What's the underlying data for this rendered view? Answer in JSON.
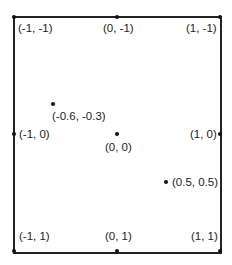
{
  "diagram": {
    "title": "",
    "frame": {
      "left": 13,
      "top": 16,
      "right": 220,
      "bottom": 252
    },
    "edge_points": [
      {
        "label": "(-1, -1)",
        "x": 15,
        "y": 17,
        "lx": 18,
        "ly": 22
      },
      {
        "label": "(0, -1)",
        "x": 117,
        "y": 17,
        "lx": 104,
        "ly": 22
      },
      {
        "label": "(1, -1)",
        "x": 220,
        "y": 17,
        "lx": 187,
        "ly": 22
      },
      {
        "label": "(-1, 0)",
        "x": 14,
        "y": 134,
        "lx": 19,
        "ly": 128
      },
      {
        "label": "(1, 0)",
        "x": 220,
        "y": 134,
        "lx": 190,
        "ly": 128
      },
      {
        "label": "(-1, 1)",
        "x": 14,
        "y": 251,
        "lx": 19,
        "ly": 230
      },
      {
        "label": "(0, 1)",
        "x": 117,
        "y": 251,
        "lx": 105,
        "ly": 230
      },
      {
        "label": "(1, 1)",
        "x": 220,
        "y": 251,
        "lx": 191,
        "ly": 230
      }
    ],
    "interior_points": [
      {
        "label": "(-0.6, -0.3)",
        "x": 53,
        "y": 104,
        "lx": 52,
        "ly": 110
      },
      {
        "label": "(0, 0)",
        "x": 117,
        "y": 134,
        "lx": 105,
        "ly": 141
      },
      {
        "label": "(0.5, 0.5)",
        "x": 166,
        "y": 182,
        "lx": 172,
        "ly": 176
      }
    ]
  },
  "labels": {
    "tl": "(-1, -1)",
    "tm": "(0, -1)",
    "tr": "(1, -1)",
    "ml": "(-1, 0)",
    "mr": "(1, 0)",
    "bl": "(-1, 1)",
    "bm": "(0, 1)",
    "br": "(1, 1)",
    "p1": "(-0.6, -0.3)",
    "p2": "(0, 0)",
    "p3": "(0.5, 0.5)"
  }
}
